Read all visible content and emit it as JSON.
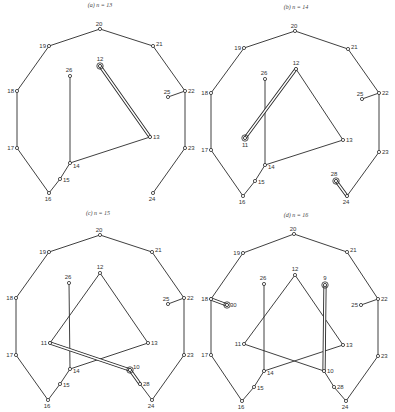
{
  "figure": {
    "panels": [
      {
        "id": "a",
        "title": "(a)  n = 13",
        "title_pos": [
          100,
          7
        ],
        "nodes": [
          {
            "id": "20",
            "x": 100,
            "y": 29,
            "lx": -3,
            "ly": -3
          },
          {
            "id": "21",
            "x": 153,
            "y": 46,
            "lx": 3,
            "ly": 0
          },
          {
            "id": "22",
            "x": 185,
            "y": 91,
            "lx": 3,
            "ly": 2
          },
          {
            "id": "23",
            "x": 185,
            "y": 148,
            "lx": 3,
            "ly": 2
          },
          {
            "id": "24",
            "x": 153,
            "y": 193,
            "lx": -3,
            "ly": 8
          },
          {
            "id": "16",
            "x": 49,
            "y": 193,
            "lx": -3,
            "ly": 8
          },
          {
            "id": "17",
            "x": 17,
            "y": 148,
            "lx": -8,
            "ly": 2
          },
          {
            "id": "18",
            "x": 17,
            "y": 91,
            "lx": -8,
            "ly": 2
          },
          {
            "id": "19",
            "x": 49,
            "y": 46,
            "lx": -8,
            "ly": 2
          },
          {
            "id": "12",
            "x": 100,
            "y": 66,
            "lx": -2,
            "ly": -5,
            "marked": true
          },
          {
            "id": "13",
            "x": 150,
            "y": 137,
            "lx": 3,
            "ly": 2
          },
          {
            "id": "14",
            "x": 70,
            "y": 163,
            "lx": 3,
            "ly": 5
          },
          {
            "id": "15",
            "x": 60,
            "y": 179,
            "lx": 3,
            "ly": 3
          },
          {
            "id": "26",
            "x": 70,
            "y": 76,
            "lx": -3,
            "ly": -4
          },
          {
            "id": "25",
            "x": 168,
            "y": 97,
            "lx": -3,
            "ly": -3
          }
        ],
        "edges": [
          [
            "20",
            "21"
          ],
          [
            "21",
            "22"
          ],
          [
            "22",
            "23"
          ],
          [
            "23",
            "24"
          ],
          [
            "16",
            "17"
          ],
          [
            "17",
            "18"
          ],
          [
            "18",
            "19"
          ],
          [
            "19",
            "20"
          ],
          [
            "16",
            "15"
          ],
          [
            "15",
            "14"
          ],
          [
            "14",
            "26"
          ],
          [
            "14",
            "13"
          ],
          [
            "22",
            "25"
          ]
        ],
        "double_edges": [
          [
            "12",
            "13"
          ]
        ]
      },
      {
        "id": "b",
        "title": "(b)  n = 14",
        "title_pos": [
          296,
          9
        ],
        "nodes": [
          {
            "id": "20",
            "x": 295,
            "y": 31,
            "lx": -3,
            "ly": -3
          },
          {
            "id": "21",
            "x": 348,
            "y": 49,
            "lx": 3,
            "ly": 0
          },
          {
            "id": "22",
            "x": 379,
            "y": 93,
            "lx": 3,
            "ly": 2
          },
          {
            "id": "23",
            "x": 379,
            "y": 152,
            "lx": 3,
            "ly": 2
          },
          {
            "id": "24",
            "x": 347,
            "y": 196,
            "lx": -3,
            "ly": 8
          },
          {
            "id": "16",
            "x": 243,
            "y": 196,
            "lx": -3,
            "ly": 8
          },
          {
            "id": "17",
            "x": 211,
            "y": 150,
            "lx": -8,
            "ly": 2
          },
          {
            "id": "18",
            "x": 211,
            "y": 93,
            "lx": -8,
            "ly": 2
          },
          {
            "id": "19",
            "x": 244,
            "y": 48,
            "lx": -8,
            "ly": 2
          },
          {
            "id": "12",
            "x": 296,
            "y": 69,
            "lx": -2,
            "ly": -4
          },
          {
            "id": "13",
            "x": 343,
            "y": 140,
            "lx": 3,
            "ly": 2
          },
          {
            "id": "14",
            "x": 265,
            "y": 165,
            "lx": 3,
            "ly": 4
          },
          {
            "id": "15",
            "x": 255,
            "y": 181,
            "lx": 3,
            "ly": 3
          },
          {
            "id": "26",
            "x": 265,
            "y": 79,
            "lx": -3,
            "ly": -4
          },
          {
            "id": "25",
            "x": 362,
            "y": 99,
            "lx": -4,
            "ly": -3
          },
          {
            "id": "11",
            "x": 245,
            "y": 138,
            "lx": -2,
            "ly": 9,
            "marked": true
          },
          {
            "id": "28",
            "x": 336,
            "y": 181,
            "lx": -4,
            "ly": -5,
            "marked": true
          }
        ],
        "edges": [
          [
            "20",
            "21"
          ],
          [
            "21",
            "22"
          ],
          [
            "22",
            "23"
          ],
          [
            "23",
            "24"
          ],
          [
            "16",
            "17"
          ],
          [
            "17",
            "18"
          ],
          [
            "18",
            "19"
          ],
          [
            "19",
            "20"
          ],
          [
            "16",
            "15"
          ],
          [
            "15",
            "14"
          ],
          [
            "14",
            "26"
          ],
          [
            "14",
            "13"
          ],
          [
            "12",
            "13"
          ],
          [
            "22",
            "25"
          ]
        ],
        "double_edges": [
          [
            "12",
            "11"
          ],
          [
            "28",
            "24"
          ]
        ]
      },
      {
        "id": "c",
        "title": "(c)  n = 15",
        "title_pos": [
          98,
          215
        ],
        "nodes": [
          {
            "id": "20",
            "x": 100,
            "y": 235,
            "lx": -3,
            "ly": -3
          },
          {
            "id": "21",
            "x": 152,
            "y": 252,
            "lx": 3,
            "ly": 0
          },
          {
            "id": "22",
            "x": 184,
            "y": 298,
            "lx": 3,
            "ly": 2
          },
          {
            "id": "23",
            "x": 184,
            "y": 355,
            "lx": 3,
            "ly": 2
          },
          {
            "id": "24",
            "x": 152,
            "y": 400,
            "lx": -3,
            "ly": 8
          },
          {
            "id": "16",
            "x": 48,
            "y": 400,
            "lx": -3,
            "ly": 8
          },
          {
            "id": "17",
            "x": 16,
            "y": 355,
            "lx": -8,
            "ly": 2
          },
          {
            "id": "18",
            "x": 16,
            "y": 298,
            "lx": -8,
            "ly": 2
          },
          {
            "id": "19",
            "x": 49,
            "y": 252,
            "lx": -8,
            "ly": 2
          },
          {
            "id": "12",
            "x": 100,
            "y": 273,
            "lx": -2,
            "ly": -4
          },
          {
            "id": "13",
            "x": 148,
            "y": 343,
            "lx": 3,
            "ly": 2
          },
          {
            "id": "14",
            "x": 70,
            "y": 369,
            "lx": 3,
            "ly": 4
          },
          {
            "id": "15",
            "x": 60,
            "y": 384,
            "lx": 3,
            "ly": 3
          },
          {
            "id": "26",
            "x": 69,
            "y": 283,
            "lx": -3,
            "ly": -4
          },
          {
            "id": "25",
            "x": 168,
            "y": 304,
            "lx": -4,
            "ly": -3
          },
          {
            "id": "11",
            "x": 50,
            "y": 343,
            "lx": -6,
            "ly": 2
          },
          {
            "id": "10",
            "x": 130,
            "y": 370,
            "lx": 3,
            "ly": -1,
            "marked": true
          },
          {
            "id": "28",
            "x": 140,
            "y": 384,
            "lx": 3,
            "ly": 2
          }
        ],
        "edges": [
          [
            "20",
            "21"
          ],
          [
            "21",
            "22"
          ],
          [
            "22",
            "23"
          ],
          [
            "23",
            "24"
          ],
          [
            "16",
            "17"
          ],
          [
            "17",
            "18"
          ],
          [
            "18",
            "19"
          ],
          [
            "19",
            "20"
          ],
          [
            "16",
            "15"
          ],
          [
            "15",
            "14"
          ],
          [
            "14",
            "26"
          ],
          [
            "14",
            "13"
          ],
          [
            "12",
            "13"
          ],
          [
            "12",
            "11"
          ],
          [
            "22",
            "25"
          ],
          [
            "28",
            "24"
          ]
        ],
        "double_edges": [
          [
            "11",
            "10"
          ],
          [
            "10",
            "28"
          ]
        ]
      },
      {
        "id": "d",
        "title": "(d)  n = 16",
        "title_pos": [
          296,
          217
        ],
        "nodes": [
          {
            "id": "20",
            "x": 294,
            "y": 234,
            "lx": -3,
            "ly": -3
          },
          {
            "id": "21",
            "x": 347,
            "y": 252,
            "lx": 3,
            "ly": 0
          },
          {
            "id": "22",
            "x": 378,
            "y": 299,
            "lx": 3,
            "ly": 2
          },
          {
            "id": "23",
            "x": 378,
            "y": 356,
            "lx": 3,
            "ly": 2
          },
          {
            "id": "24",
            "x": 346,
            "y": 401,
            "lx": -3,
            "ly": 8
          },
          {
            "id": "16",
            "x": 242,
            "y": 401,
            "lx": -3,
            "ly": 8
          },
          {
            "id": "17",
            "x": 211,
            "y": 355,
            "lx": -8,
            "ly": 2
          },
          {
            "id": "18",
            "x": 211,
            "y": 299,
            "lx": -8,
            "ly": 2
          },
          {
            "id": "19",
            "x": 243,
            "y": 253,
            "lx": -8,
            "ly": 2
          },
          {
            "id": "12",
            "x": 295,
            "y": 275,
            "lx": -2,
            "ly": -4
          },
          {
            "id": "13",
            "x": 343,
            "y": 345,
            "lx": 3,
            "ly": 2
          },
          {
            "id": "14",
            "x": 264,
            "y": 371,
            "lx": 3,
            "ly": 4
          },
          {
            "id": "15",
            "x": 254,
            "y": 387,
            "lx": 3,
            "ly": 3
          },
          {
            "id": "26",
            "x": 264,
            "y": 284,
            "lx": -3,
            "ly": -4
          },
          {
            "id": "25",
            "x": 361,
            "y": 305,
            "lx": -10,
            "ly": 2
          },
          {
            "id": "11",
            "x": 244,
            "y": 344,
            "lx": -6,
            "ly": 2
          },
          {
            "id": "10",
            "x": 324,
            "y": 371,
            "lx": 3,
            "ly": 2
          },
          {
            "id": "28",
            "x": 334,
            "y": 387,
            "lx": 3,
            "ly": 2
          },
          {
            "id": "9",
            "x": 325,
            "y": 285,
            "lx": -2,
            "ly": -5,
            "marked": true
          },
          {
            "id": "30",
            "x": 227,
            "y": 305,
            "lx": 4,
            "ly": 2,
            "marked": true
          }
        ],
        "edges": [
          [
            "20",
            "21"
          ],
          [
            "21",
            "22"
          ],
          [
            "22",
            "23"
          ],
          [
            "23",
            "24"
          ],
          [
            "16",
            "17"
          ],
          [
            "17",
            "18"
          ],
          [
            "18",
            "19"
          ],
          [
            "19",
            "20"
          ],
          [
            "16",
            "15"
          ],
          [
            "15",
            "14"
          ],
          [
            "14",
            "26"
          ],
          [
            "14",
            "13"
          ],
          [
            "12",
            "13"
          ],
          [
            "12",
            "11"
          ],
          [
            "11",
            "10"
          ],
          [
            "22",
            "25"
          ],
          [
            "10",
            "28"
          ],
          [
            "28",
            "24"
          ]
        ],
        "double_edges": [
          [
            "9",
            "10"
          ],
          [
            "18",
            "30"
          ]
        ]
      }
    ]
  }
}
